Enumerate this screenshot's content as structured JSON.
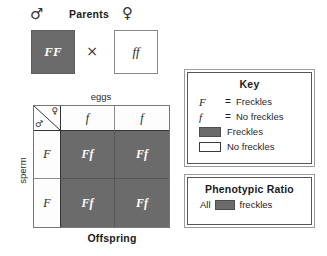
{
  "diagram": {
    "parents": {
      "heading": "Parents",
      "male_symbol": "♂",
      "female_symbol": "♀",
      "cross_symbol": "×",
      "male_genotype": "FF",
      "female_genotype": "ff",
      "male_fill": "#6b6b6b",
      "female_fill": "#ffffff"
    },
    "punnett": {
      "top_axis_label": "eggs",
      "side_axis_label": "sperm",
      "bottom_label": "Offspring",
      "corner_female_symbol": "♀",
      "corner_male_symbol": "♂",
      "column_headers": [
        "f",
        "f"
      ],
      "row_headers": [
        "F",
        "F"
      ],
      "cells": [
        [
          "Ff",
          "Ff"
        ],
        [
          "Ff",
          "Ff"
        ]
      ],
      "cell_fill": "#6b6b6b",
      "header_fill": "#fdfdfd"
    },
    "key": {
      "title": "Key",
      "rows": [
        {
          "gene": "F",
          "equals": "=",
          "swatch": "none",
          "text": "Freckles"
        },
        {
          "gene": "f",
          "equals": "=",
          "swatch": "none",
          "text": "No freckles"
        },
        {
          "gene": "",
          "equals": "",
          "swatch": "dark",
          "text": "Freckles"
        },
        {
          "gene": "",
          "equals": "",
          "swatch": "light",
          "text": "No freckles"
        }
      ]
    },
    "ratio": {
      "title": "Phenotypic Ratio",
      "prefix": "All",
      "swatch": "dark",
      "suffix": "freckles"
    }
  }
}
